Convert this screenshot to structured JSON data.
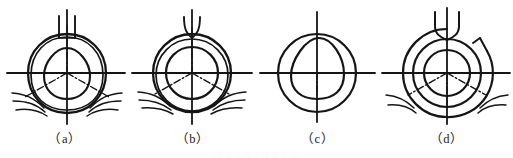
{
  "figure": {
    "title": "",
    "background_color": "#ffffff",
    "line_color": "#151515",
    "panel_count": 4,
    "panels": [
      {
        "id": "panel-a",
        "caption": "（a）",
        "description": "Outer offset double contour with rounded-triangle core and three dash-dot spokes",
        "center_x": 67,
        "center_y": 73,
        "outer_radius": 39,
        "inner_shape": "rounded-triangle",
        "top_feature": "twin-stem",
        "lead_lines_left": 3,
        "lead_lines_right": 3,
        "spokes": 3,
        "spoke_angles_deg": [
          90,
          210,
          330
        ]
      },
      {
        "id": "panel-b",
        "caption": "（b）",
        "description": "Concentric offset double outer contour with plain inner circle and three dash-dot spokes",
        "center_x": 192,
        "center_y": 73,
        "outer_radius": 39,
        "inner_shape": "circle",
        "inner_radius": 26,
        "top_feature": "twin-stem",
        "lead_lines_left": 3,
        "lead_lines_right": 3,
        "spokes": 3,
        "spoke_angles_deg": [
          90,
          210,
          330
        ]
      },
      {
        "id": "panel-c",
        "caption": "（c）",
        "description": "Single circle with rounded-triangle core and plain cross centre lines",
        "center_x": 317,
        "center_y": 73,
        "outer_radius": 39,
        "inner_shape": "rounded-triangle",
        "top_feature": "none",
        "lead_lines_left": 0,
        "lead_lines_right": 0,
        "spokes": 0
      },
      {
        "id": "panel-d",
        "caption": "（d）",
        "description": "Three concentric circles with notched outer ring, U-tube top and three dash-dot spokes",
        "center_x": 447,
        "center_y": 73,
        "outer_radius": 44,
        "middle_radius": 34,
        "inner_radius": 23,
        "inner_shape": "circle",
        "top_feature": "u-tube",
        "notch": "upper-right",
        "lead_lines_left": 2,
        "lead_lines_right": 2,
        "spokes": 3,
        "spoke_angles_deg": [
          90,
          210,
          330
        ]
      }
    ],
    "footnote": "图 3-5 轴承座剖视图"
  }
}
